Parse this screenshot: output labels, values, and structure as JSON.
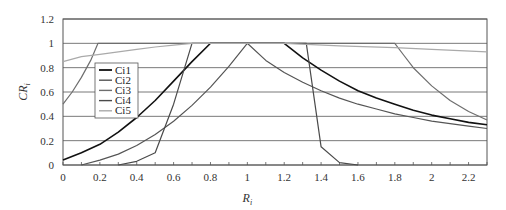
{
  "chart_data": {
    "type": "line",
    "title": "",
    "xlabel": "R_i",
    "ylabel": "CR_i",
    "xlabel_main": "R",
    "xlabel_sub": "i",
    "ylabel_main": "CR",
    "ylabel_sub": "i",
    "xlim": [
      0,
      2.3
    ],
    "ylim": [
      0,
      1.2
    ],
    "x_ticks": [
      "0",
      "0.2",
      "0.4",
      "0.6",
      "0.8",
      "1",
      "1.2",
      "1.4",
      "1.6",
      "1.8",
      "2",
      "2.2"
    ],
    "x_tick_values": [
      0,
      0.2,
      0.4,
      0.6,
      0.8,
      1.0,
      1.2,
      1.4,
      1.6,
      1.8,
      2.0,
      2.2
    ],
    "y_ticks": [
      "0",
      "0.2",
      "0.4",
      "0.6",
      "0.8",
      "1",
      "1.2"
    ],
    "y_tick_values": [
      0,
      0.2,
      0.4,
      0.6,
      0.8,
      1.0,
      1.2
    ],
    "grid": "horizontal",
    "legend_position": "upper-left (inside)",
    "series": [
      {
        "name": "Ci1",
        "color": "#111111",
        "width": 1.6,
        "points": [
          [
            0,
            0.04
          ],
          [
            0.1,
            0.1
          ],
          [
            0.2,
            0.17
          ],
          [
            0.3,
            0.27
          ],
          [
            0.4,
            0.39
          ],
          [
            0.5,
            0.53
          ],
          [
            0.6,
            0.69
          ],
          [
            0.7,
            0.85
          ],
          [
            0.8,
            1.0
          ],
          [
            1.2,
            1.0
          ],
          [
            1.3,
            0.88
          ],
          [
            1.4,
            0.78
          ],
          [
            1.5,
            0.69
          ],
          [
            1.6,
            0.61
          ],
          [
            1.7,
            0.55
          ],
          [
            1.8,
            0.5
          ],
          [
            1.9,
            0.45
          ],
          [
            2.0,
            0.41
          ],
          [
            2.1,
            0.38
          ],
          [
            2.2,
            0.35
          ],
          [
            2.3,
            0.33
          ]
        ]
      },
      {
        "name": "Ci2",
        "color": "#555555",
        "width": 1.2,
        "points": [
          [
            0.1,
            0.0
          ],
          [
            0.2,
            0.04
          ],
          [
            0.3,
            0.09
          ],
          [
            0.4,
            0.16
          ],
          [
            0.5,
            0.25
          ],
          [
            0.6,
            0.36
          ],
          [
            0.7,
            0.49
          ],
          [
            0.8,
            0.64
          ],
          [
            0.9,
            0.81
          ],
          [
            1.0,
            1.0
          ],
          [
            1.1,
            0.86
          ],
          [
            1.2,
            0.76
          ],
          [
            1.3,
            0.68
          ],
          [
            1.4,
            0.61
          ],
          [
            1.5,
            0.55
          ],
          [
            1.6,
            0.5
          ],
          [
            1.7,
            0.46
          ],
          [
            1.8,
            0.42
          ],
          [
            1.9,
            0.39
          ],
          [
            2.0,
            0.36
          ],
          [
            2.1,
            0.34
          ],
          [
            2.2,
            0.32
          ],
          [
            2.3,
            0.3
          ]
        ]
      },
      {
        "name": "Ci3",
        "color": "#6e6e6e",
        "width": 1.2,
        "points": [
          [
            0,
            0.5
          ],
          [
            0.05,
            0.6
          ],
          [
            0.1,
            0.72
          ],
          [
            0.15,
            0.86
          ],
          [
            0.19,
            1.0
          ],
          [
            1.8,
            1.0
          ],
          [
            1.85,
            0.9
          ],
          [
            1.9,
            0.8
          ],
          [
            2.0,
            0.65
          ],
          [
            2.1,
            0.53
          ],
          [
            2.2,
            0.44
          ],
          [
            2.3,
            0.37
          ]
        ]
      },
      {
        "name": "Ci4",
        "color": "#4a4a4a",
        "width": 1.2,
        "points": [
          [
            0.3,
            0.0
          ],
          [
            0.4,
            0.03
          ],
          [
            0.5,
            0.1
          ],
          [
            0.6,
            0.5
          ],
          [
            0.7,
            1.0
          ],
          [
            1.32,
            1.0
          ],
          [
            1.4,
            0.15
          ],
          [
            1.5,
            0.02
          ],
          [
            1.6,
            0.0
          ]
        ]
      },
      {
        "name": "Ci5",
        "color": "#aaaaaa",
        "width": 1.2,
        "points": [
          [
            0,
            0.85
          ],
          [
            0.1,
            0.89
          ],
          [
            0.2,
            0.91
          ],
          [
            0.3,
            0.93
          ],
          [
            0.4,
            0.95
          ],
          [
            0.5,
            0.97
          ],
          [
            0.6,
            0.985
          ],
          [
            0.7,
            1.0
          ],
          [
            1.2,
            1.0
          ],
          [
            1.5,
            0.98
          ],
          [
            1.8,
            0.965
          ],
          [
            2.0,
            0.95
          ],
          [
            2.3,
            0.93
          ]
        ]
      }
    ]
  }
}
